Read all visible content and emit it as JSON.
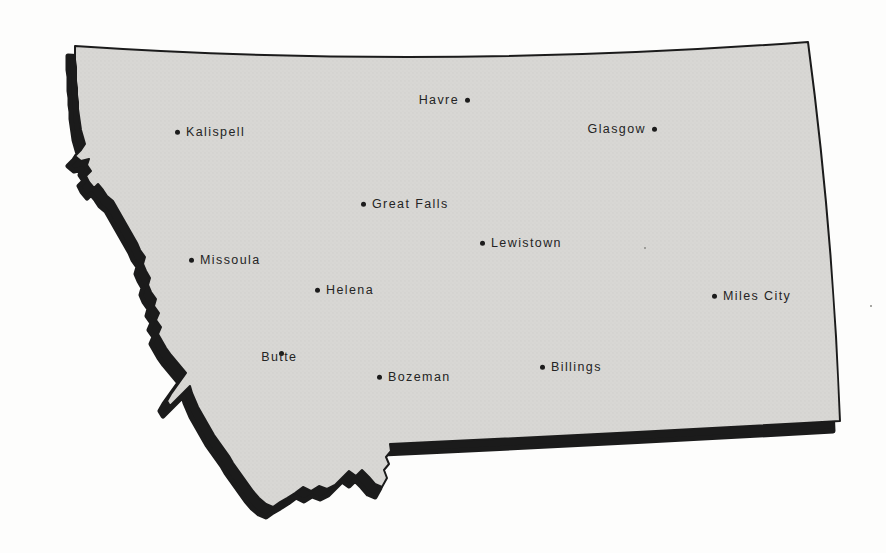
{
  "map": {
    "state_name": "Montana",
    "fill_color": "#d8d7d4",
    "halftone_color": "#cfcecb",
    "outline_color": "#1b1b1b",
    "dot_color": "#1c1c1c",
    "background_color": "#fdfdfc",
    "cities": [
      {
        "name": "Kalispell",
        "x": 178,
        "y": 132,
        "label_side": "right"
      },
      {
        "name": "Havre",
        "x": 467,
        "y": 100,
        "label_side": "left"
      },
      {
        "name": "Glasgow",
        "x": 654,
        "y": 129,
        "label_side": "left"
      },
      {
        "name": "Great Falls",
        "x": 364,
        "y": 204,
        "label_side": "right"
      },
      {
        "name": "Missoula",
        "x": 192,
        "y": 260,
        "label_side": "right"
      },
      {
        "name": "Lewistown",
        "x": 483,
        "y": 243,
        "label_side": "right"
      },
      {
        "name": "Helena",
        "x": 318,
        "y": 290,
        "label_side": "right"
      },
      {
        "name": "Butte",
        "x": 282,
        "y": 345,
        "label_side": "below"
      },
      {
        "name": "Bozeman",
        "x": 380,
        "y": 377,
        "label_side": "right"
      },
      {
        "name": "Billings",
        "x": 543,
        "y": 367,
        "label_side": "right"
      },
      {
        "name": "Miles City",
        "x": 715,
        "y": 296,
        "label_side": "right"
      }
    ],
    "artifact_dots": [
      {
        "x": 644,
        "y": 247
      },
      {
        "x": 870,
        "y": 305
      }
    ]
  }
}
